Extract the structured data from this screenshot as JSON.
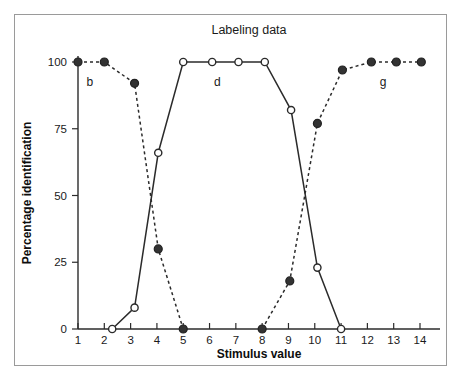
{
  "figure": {
    "title": "Labeling data",
    "frame_border_color": "#9a9a9a",
    "background_color": "#ffffff",
    "line_color": "#2b2b2b"
  },
  "chart_data": {
    "type": "line",
    "title": "Labeling data",
    "xlabel": "Stimulus value",
    "ylabel": "Percentage identification",
    "xlim": [
      1,
      14
    ],
    "ylim": [
      0,
      100
    ],
    "xticks": [
      1,
      2,
      3,
      4,
      5,
      6,
      7,
      8,
      9,
      10,
      11,
      12,
      13,
      14
    ],
    "xtick_labels": [
      "1",
      "2",
      "3",
      "4",
      "5",
      "6",
      "7",
      "8",
      "9",
      "10",
      "11",
      "12",
      "13",
      "14"
    ],
    "yticks": [
      0,
      25,
      50,
      75,
      100
    ],
    "ytick_labels": [
      "0",
      "25",
      "50",
      "75",
      "100"
    ],
    "grid": false,
    "legend": "inline annotations",
    "annotations": [
      {
        "text": "b",
        "x": 1.45,
        "y": 91
      },
      {
        "text": "d",
        "x": 6.3,
        "y": 91
      },
      {
        "text": "g",
        "x": 12.6,
        "y": 91
      }
    ],
    "series": [
      {
        "name": "b",
        "label": "b",
        "style": "dashed",
        "marker": "filled-circle",
        "x": [
          1,
          2,
          3.15,
          4.05,
          5
        ],
        "values": [
          100,
          100,
          92,
          30,
          0
        ]
      },
      {
        "name": "d",
        "label": "d",
        "style": "solid",
        "marker": "open-circle",
        "x": [
          2.3,
          3.15,
          4.05,
          5,
          6.1,
          7.1,
          8.1,
          9.1,
          10.1,
          11
        ],
        "values": [
          0,
          8,
          66,
          100,
          100,
          100,
          100,
          82,
          23,
          0
        ]
      },
      {
        "name": "g",
        "label": "g",
        "style": "dashed",
        "marker": "filled-circle",
        "x": [
          8,
          9.05,
          10.1,
          11.05,
          12.15,
          13.1,
          14.05
        ],
        "values": [
          0,
          18,
          77,
          97,
          100,
          100,
          100
        ]
      }
    ]
  }
}
